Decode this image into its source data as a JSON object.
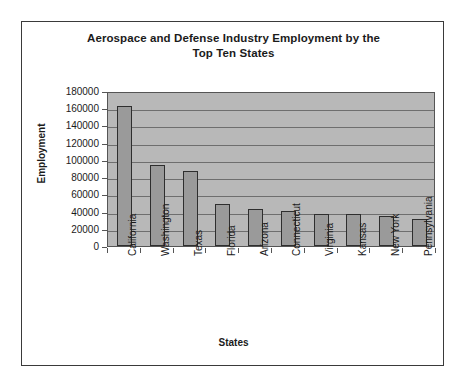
{
  "chart_data": {
    "type": "bar",
    "title": "Aerospace and Defense Industry Employment by the Top Ten States",
    "title_line1": "Aerospace and Defense Industry Employment by the",
    "title_line2": "Top Ten States",
    "xlabel": "States",
    "ylabel": "Employment",
    "ylim": [
      0,
      180000
    ],
    "ytick_step": 20000,
    "yticks": [
      180000,
      160000,
      140000,
      120000,
      100000,
      80000,
      60000,
      40000,
      20000,
      0
    ],
    "ytick_labels": [
      "180000",
      "160000",
      "140000",
      "120000",
      "100000",
      "80000",
      "60000",
      "40000",
      "20000",
      "0"
    ],
    "grid": true,
    "grid_orientation": "horizontal",
    "legend": "none",
    "categories": [
      "California",
      "Washington",
      "Texas",
      "Florida",
      "Arizona",
      "Connecticut",
      "Virginia",
      "Kansas",
      "New York",
      "Pennsylvania"
    ],
    "values": [
      163000,
      94000,
      87000,
      49000,
      43000,
      41000,
      37000,
      37000,
      35000,
      31000
    ],
    "series": [
      {
        "name": "Employment",
        "values": [
          163000,
          94000,
          87000,
          49000,
          43000,
          41000,
          37000,
          37000,
          35000,
          31000
        ]
      }
    ]
  },
  "style": {
    "plot_background": "#b8b8b8",
    "bar_fill": "#9a9a9a",
    "bar_border": "#2e2e2e",
    "gridline_color": "#6e6e6e",
    "axis_color": "#555555",
    "frame_border": "#3a3a3a",
    "text_color": "#1b1b1b"
  }
}
